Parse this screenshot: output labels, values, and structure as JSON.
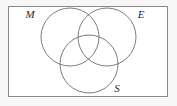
{
  "figure": {
    "name": "three-set-venn-diagram",
    "type": "venn",
    "sets": 3,
    "background_color": "#f7f7f7",
    "fill_color": "#ffffff",
    "stroke_color": "#6e6e6e",
    "label_color": "#2b2b2b"
  },
  "universe": {
    "shape": "rectangle",
    "x": 8,
    "y": 6,
    "width": 160,
    "height": 91,
    "stroke_color": "#8a8a8a",
    "stroke_width": 1
  },
  "circles": [
    {
      "id": "circle-m",
      "label": "M",
      "cx": 70,
      "cy": 37,
      "r": 29,
      "label_x": 30,
      "label_y": 18
    },
    {
      "id": "circle-e",
      "label": "E",
      "cx": 107,
      "cy": 37,
      "r": 29,
      "label_x": 141,
      "label_y": 18
    },
    {
      "id": "circle-s",
      "label": "S",
      "cx": 89,
      "cy": 64,
      "r": 29,
      "label_x": 117,
      "label_y": 92
    }
  ],
  "labels": {
    "m": "M",
    "e": "E",
    "s": "S"
  }
}
